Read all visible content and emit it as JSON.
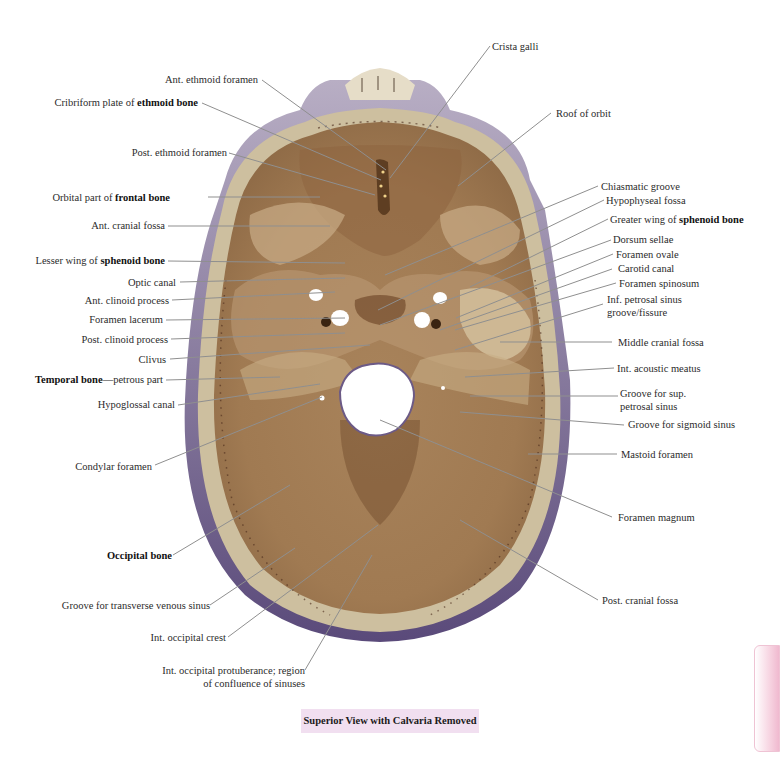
{
  "figure": {
    "caption": "Superior View with Calvaria Removed",
    "colors": {
      "background": "#ffffff",
      "bone_light": "#d8c6a4",
      "bone_mid": "#b08a60",
      "bone_dark": "#8a6440",
      "cortex_rim": "#6e5a86",
      "leader_line": "#8f8f8f",
      "caption_bg": "#f1dff0",
      "side_tab": "#f0b9cf"
    }
  },
  "labels_left": [
    {
      "id": "ant-ethmoid-foramen",
      "pre": "Ant. ethmoid foramen",
      "bold": "",
      "post": ""
    },
    {
      "id": "cribriform-plate",
      "pre": "Cribriform plate of ",
      "bold": "ethmoid bone",
      "post": ""
    },
    {
      "id": "post-ethmoid-foramen",
      "pre": "Post. ethmoid foramen",
      "bold": "",
      "post": ""
    },
    {
      "id": "orbital-part-frontal",
      "pre": "Orbital part of ",
      "bold": "frontal bone",
      "post": ""
    },
    {
      "id": "ant-cranial-fossa",
      "pre": "Ant. cranial fossa",
      "bold": "",
      "post": ""
    },
    {
      "id": "lesser-wing-sphenoid",
      "pre": "Lesser wing of ",
      "bold": "sphenoid bone",
      "post": ""
    },
    {
      "id": "optic-canal",
      "pre": "Optic canal",
      "bold": "",
      "post": ""
    },
    {
      "id": "ant-clinoid-process",
      "pre": "Ant. clinoid process",
      "bold": "",
      "post": ""
    },
    {
      "id": "foramen-lacerum",
      "pre": "Foramen lacerum",
      "bold": "",
      "post": ""
    },
    {
      "id": "post-clinoid-process",
      "pre": "Post. clinoid process",
      "bold": "",
      "post": ""
    },
    {
      "id": "clivus",
      "pre": "Clivus",
      "bold": "",
      "post": ""
    },
    {
      "id": "temporal-bone-petrous",
      "pre": "",
      "bold": "Temporal bone",
      "post": "—petrous part"
    },
    {
      "id": "hypoglossal-canal",
      "pre": "Hypoglossal canal",
      "bold": "",
      "post": ""
    },
    {
      "id": "condylar-foramen",
      "pre": "Condylar foramen",
      "bold": "",
      "post": ""
    },
    {
      "id": "occipital-bone",
      "pre": "",
      "bold": "Occipital bone",
      "post": ""
    },
    {
      "id": "groove-transverse-sinus",
      "pre": "Groove for transverse venous sinus",
      "bold": "",
      "post": ""
    },
    {
      "id": "int-occipital-crest",
      "pre": "Int. occipital crest",
      "bold": "",
      "post": ""
    },
    {
      "id": "int-occipital-protuberance",
      "pre": "Int. occipital protuberance; region",
      "bold": "",
      "post": "",
      "line2": "of confluence of sinuses"
    }
  ],
  "labels_right": [
    {
      "id": "crista-galli",
      "pre": "Crista galli",
      "bold": "",
      "post": ""
    },
    {
      "id": "roof-of-orbit",
      "pre": "Roof of orbit",
      "bold": "",
      "post": ""
    },
    {
      "id": "chiasmatic-groove",
      "pre": "Chiasmatic groove",
      "bold": "",
      "post": ""
    },
    {
      "id": "hypophyseal-fossa",
      "pre": "Hypophyseal fossa",
      "bold": "",
      "post": ""
    },
    {
      "id": "greater-wing-sphenoid",
      "pre": "Greater wing of ",
      "bold": "sphenoid bone",
      "post": ""
    },
    {
      "id": "dorsum-sellae",
      "pre": "Dorsum sellae",
      "bold": "",
      "post": ""
    },
    {
      "id": "foramen-ovale",
      "pre": "Foramen ovale",
      "bold": "",
      "post": ""
    },
    {
      "id": "carotid-canal",
      "pre": "Carotid canal",
      "bold": "",
      "post": ""
    },
    {
      "id": "foramen-spinosum",
      "pre": "Foramen spinosum",
      "bold": "",
      "post": ""
    },
    {
      "id": "inf-petrosal-sinus",
      "pre": "Inf. petrosal sinus",
      "bold": "",
      "post": "",
      "line2": "groove/fissure"
    },
    {
      "id": "middle-cranial-fossa",
      "pre": "Middle cranial fossa",
      "bold": "",
      "post": ""
    },
    {
      "id": "int-acoustic-meatus",
      "pre": "Int. acoustic meatus",
      "bold": "",
      "post": ""
    },
    {
      "id": "groove-sup-petrosal",
      "pre": "Groove for sup.",
      "bold": "",
      "post": "",
      "line2": "petrosal sinus"
    },
    {
      "id": "groove-sigmoid-sinus",
      "pre": "Groove for sigmoid sinus",
      "bold": "",
      "post": ""
    },
    {
      "id": "mastoid-foramen",
      "pre": "Mastoid foramen",
      "bold": "",
      "post": ""
    },
    {
      "id": "foramen-magnum",
      "pre": "Foramen magnum",
      "bold": "",
      "post": ""
    },
    {
      "id": "post-cranial-fossa",
      "pre": "Post. cranial fossa",
      "bold": "",
      "post": ""
    }
  ]
}
